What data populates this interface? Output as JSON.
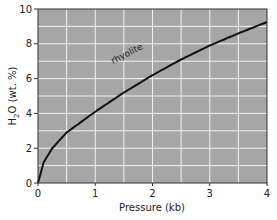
{
  "chart_data": {
    "type": "line",
    "title": "",
    "xlabel": "Pressure (kb)",
    "ylabel": "H2O (wt. %)",
    "xlim": [
      0,
      4
    ],
    "ylim": [
      0,
      10
    ],
    "xticks": [
      "0",
      "1",
      "2",
      "3",
      "4"
    ],
    "yticks": [
      "0",
      "2",
      "4",
      "6",
      "8",
      "10"
    ],
    "grid": true,
    "series": [
      {
        "name": "rhyolite",
        "x": [
          0,
          0.1,
          0.25,
          0.5,
          1.0,
          1.5,
          2.0,
          2.5,
          3.0,
          3.5,
          4.0
        ],
        "y": [
          0,
          1.2,
          2.0,
          2.9,
          4.1,
          5.2,
          6.2,
          7.1,
          7.9,
          8.6,
          9.25
        ]
      }
    ],
    "annotations": [
      {
        "text": "rhyolite",
        "x": 1.6,
        "y": 5.6
      }
    ]
  },
  "colors": {
    "plot_bg": "#a6a6a6",
    "grid": "#f2f2f2",
    "line": "#111111"
  }
}
